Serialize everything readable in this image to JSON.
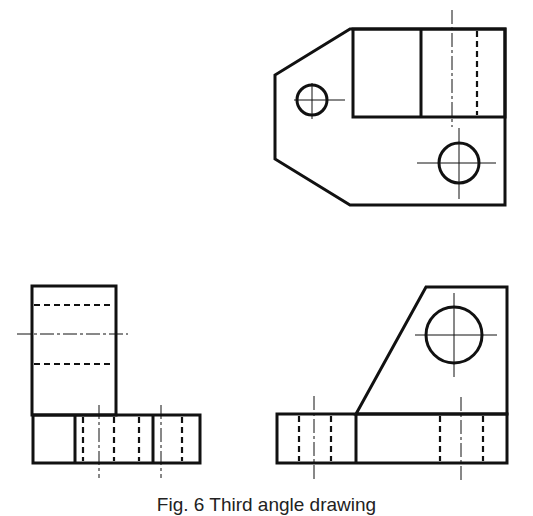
{
  "figure": {
    "caption": "Fig. 6  Third angle drawing",
    "ink_color": "#111111",
    "background": "#ffffff"
  },
  "views": [
    {
      "name": "top-view",
      "description": "Plan view with chamfered left end, raised block and two holes"
    },
    {
      "name": "front-view",
      "description": "Elevation showing upright and base with hidden bores"
    },
    {
      "name": "side-view",
      "description": "End elevation with sloped web and circular hole"
    }
  ]
}
